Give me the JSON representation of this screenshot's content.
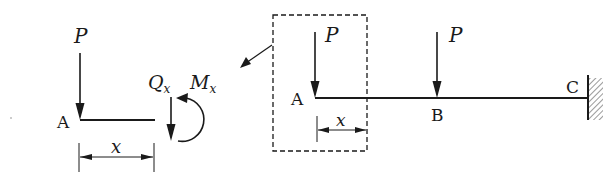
{
  "diagram": {
    "type": "cantilever beam with free-body section",
    "colors": {
      "stroke": "#1a1a1a",
      "background": "#ffffff"
    },
    "free_body": {
      "load_label": "P",
      "point_label": "A",
      "shear_label": "Q",
      "shear_sub": "x",
      "moment_label": "M",
      "moment_sub": "x",
      "dimension_label": "x"
    },
    "beam": {
      "point_a_label": "A",
      "point_b_label": "B",
      "point_c_label": "C",
      "load_a_label": "P",
      "load_b_label": "P",
      "dimension_label": "x",
      "support": "fixed wall at C"
    }
  }
}
